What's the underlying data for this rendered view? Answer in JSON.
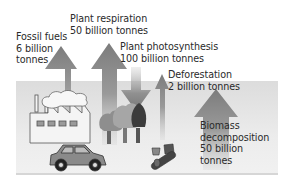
{
  "diagram": {
    "type": "carbon-cycle-flows",
    "colors": {
      "background": "#ffffff",
      "ground_band": "#e6e6e6",
      "arrow": "#8a8a8a",
      "text": "#2a2a2a"
    },
    "flows": [
      {
        "id": "fossil-fuels",
        "line1": "Fossil fuels",
        "line2": "6 billion",
        "line3": "tonnes",
        "direction": "up"
      },
      {
        "id": "plant-respiration",
        "line1": "Plant respiration",
        "line2": "50 billion tonnes",
        "direction": "up"
      },
      {
        "id": "plant-photosynthesis",
        "line1": "Plant photosynthesis",
        "line2": "100 billion tonnes",
        "direction": "down"
      },
      {
        "id": "deforestation",
        "line1": "Deforestation",
        "line2": "2 billion tonnes",
        "direction": "up"
      },
      {
        "id": "biomass-decomposition",
        "line1": "Biomass",
        "line2": "decomposition",
        "line3": "50 billion",
        "line4": "tonnes",
        "direction": "up"
      }
    ],
    "illustrations": [
      "factory",
      "smoke-cloud",
      "car",
      "trees",
      "logs"
    ]
  }
}
